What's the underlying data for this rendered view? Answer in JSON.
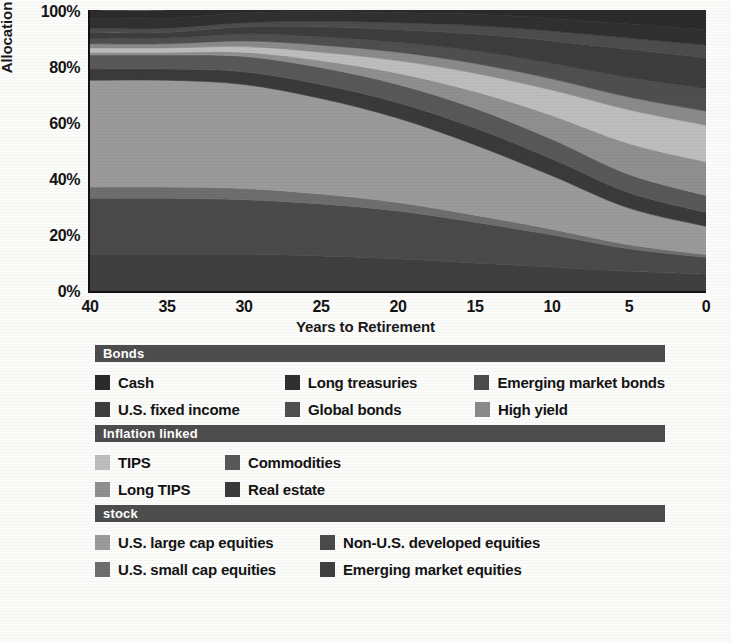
{
  "chart_data": {
    "type": "area",
    "title": "",
    "xlabel": "Years to Retirement",
    "ylabel": "Allocation (%)",
    "xlim": [
      40,
      0
    ],
    "ylim": [
      0,
      100
    ],
    "x_reversed": true,
    "grid": false,
    "stacked": true,
    "stack_order": "bottom-to-top",
    "legend_position": "below-chart",
    "x": [
      40,
      35,
      30,
      25,
      20,
      15,
      10,
      5,
      0
    ],
    "xticklabels": [
      "40",
      "35",
      "30",
      "25",
      "20",
      "15",
      "10",
      "5",
      "0"
    ],
    "yticklabels": [
      "0%",
      "20%",
      "40%",
      "60%",
      "80%",
      "100%"
    ],
    "yticks": [
      0,
      20,
      40,
      60,
      80,
      100
    ],
    "series": [
      {
        "name": "Emerging market equities",
        "color": "#3f3f3f",
        "values": [
          13,
          13,
          13,
          12.5,
          11.5,
          10,
          8.5,
          7,
          6
        ]
      },
      {
        "name": "Non-U.S. developed equities",
        "color": "#4a4a4a",
        "values": [
          20,
          20,
          19.5,
          18.5,
          17,
          14.5,
          11.5,
          8,
          6
        ]
      },
      {
        "name": "U.S. small cap equities",
        "color": "#6e6e6e",
        "values": [
          4,
          4,
          4,
          3.5,
          3,
          2.5,
          2,
          1.5,
          1
        ]
      },
      {
        "name": "U.S. large cap equities",
        "color": "#9a9a9a",
        "values": [
          38,
          38,
          37,
          34,
          30,
          25,
          19,
          13,
          10
        ]
      },
      {
        "name": "Real estate",
        "color": "#3a3a3a",
        "values": [
          4,
          4,
          4.5,
          5,
          5.5,
          6,
          6,
          5.5,
          5
        ]
      },
      {
        "name": "Commodities",
        "color": "#585858",
        "values": [
          5,
          5,
          5.5,
          6,
          6.5,
          7,
          7,
          6.5,
          6
        ]
      },
      {
        "name": "Long TIPS",
        "color": "#8f8f8f",
        "values": [
          1,
          1,
          1.5,
          2.5,
          4,
          6,
          8.5,
          11,
          12
        ]
      },
      {
        "name": "TIPS",
        "color": "#bdbdbd",
        "values": [
          1.5,
          1.5,
          2,
          3,
          4.5,
          6.5,
          9,
          12,
          13
        ]
      },
      {
        "name": "High yield",
        "color": "#8a8a8a",
        "values": [
          1.5,
          1.5,
          2,
          2.5,
          3,
          3.5,
          4,
          4.5,
          5
        ]
      },
      {
        "name": "Global bonds",
        "color": "#4f4f4f",
        "values": [
          2,
          2,
          2.5,
          3,
          3.5,
          4.5,
          5.5,
          7,
          8
        ]
      },
      {
        "name": "U.S. fixed income",
        "color": "#3d3d3d",
        "values": [
          2,
          2,
          2.5,
          3.5,
          4.5,
          6,
          8,
          10,
          11
        ]
      },
      {
        "name": "Emerging market bonds",
        "color": "#4c4c4c",
        "values": [
          1.5,
          1.5,
          1.5,
          2,
          2.5,
          3,
          3.5,
          4,
          4.5
        ]
      },
      {
        "name": "Long treasuries",
        "color": "#303030",
        "values": [
          3.5,
          3.5,
          3.5,
          3.5,
          3.5,
          4,
          4.5,
          5,
          5.5
        ]
      },
      {
        "name": "Cash",
        "color": "#2b2b2b",
        "values": [
          3,
          3,
          3,
          3.5,
          4,
          4.5,
          5.5,
          7,
          7
        ]
      }
    ]
  },
  "axis": {
    "y_title": "Allocation (%)",
    "x_title": "Years to Retirement",
    "yticks": [
      "100%",
      "80%",
      "60%",
      "40%",
      "20%",
      "0%"
    ],
    "xticks": [
      "40",
      "35",
      "30",
      "25",
      "20",
      "15",
      "10",
      "5",
      "0"
    ]
  },
  "legend": {
    "groups": [
      {
        "title": "Bonds",
        "layout": "cols-3",
        "rows": [
          [
            {
              "label": "Cash",
              "color": "#2b2b2b"
            },
            {
              "label": "Long treasuries",
              "color": "#303030"
            },
            {
              "label": "Emerging market bonds",
              "color": "#4c4c4c"
            }
          ],
          [
            {
              "label": "U.S. fixed income",
              "color": "#3d3d3d"
            },
            {
              "label": "Global bonds",
              "color": "#4f4f4f"
            },
            {
              "label": "High yield",
              "color": "#8a8a8a"
            }
          ]
        ]
      },
      {
        "title": "Inflation linked",
        "layout": "cols-2a",
        "rows": [
          [
            {
              "label": "TIPS",
              "color": "#bdbdbd"
            },
            {
              "label": "Commodities",
              "color": "#585858"
            }
          ],
          [
            {
              "label": "Long TIPS",
              "color": "#8f8f8f"
            },
            {
              "label": "Real estate",
              "color": "#3a3a3a"
            }
          ]
        ]
      },
      {
        "title": "stock",
        "layout": "cols-2b",
        "rows": [
          [
            {
              "label": "U.S. large cap equities",
              "color": "#9a9a9a"
            },
            {
              "label": "Non-U.S. developed equities",
              "color": "#4a4a4a"
            }
          ],
          [
            {
              "label": "U.S. small cap equities",
              "color": "#6e6e6e"
            },
            {
              "label": "Emerging market equities",
              "color": "#3f3f3f"
            }
          ]
        ]
      }
    ]
  },
  "theme": {
    "axis_color": "#111111",
    "header_bar_color": "#4d4d4d",
    "header_text_color": "#ffffff",
    "background": "#fbfbfa"
  }
}
